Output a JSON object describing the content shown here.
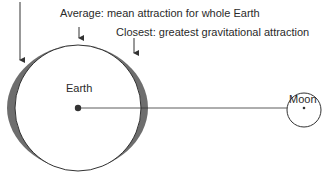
{
  "labels": {
    "average": "Average: mean attraction for whole Earth",
    "closest": "Closest: greatest gravitational attraction",
    "earth": "Earth",
    "moon": "Moon"
  },
  "colors": {
    "line": "#333333",
    "bulge": "#6e6e6e",
    "background": "#ffffff"
  }
}
